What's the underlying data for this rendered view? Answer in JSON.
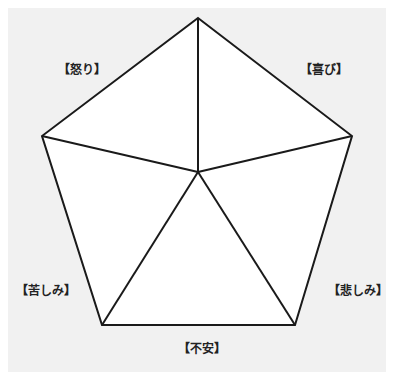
{
  "diagram": {
    "type": "pentagon-emotion-map",
    "colors": {
      "background": "#f1f1f1",
      "fill": "#ffffff",
      "stroke": "#1a1a1a"
    },
    "center": [
      198,
      172
    ],
    "vertices": [
      [
        198,
        18
      ],
      [
        352,
        136
      ],
      [
        295,
        325
      ],
      [
        102,
        325
      ],
      [
        42,
        136
      ]
    ],
    "labels": {
      "anger": "【怒り】",
      "joy": "【喜び】",
      "suffering": "【苦しみ】",
      "sadness": "【悲しみ】",
      "anxiety": "【不安】"
    }
  }
}
